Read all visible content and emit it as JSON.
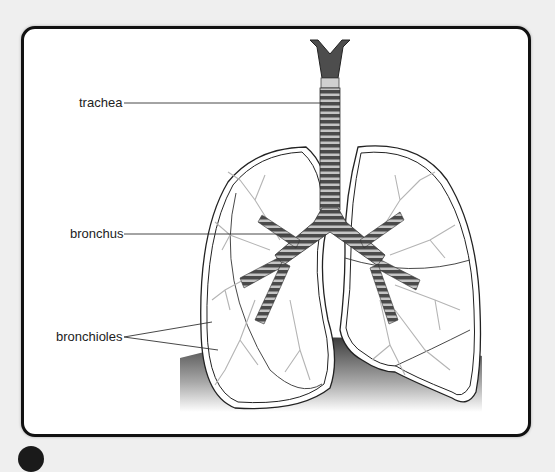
{
  "diagram": {
    "labels": [
      {
        "id": "trachea",
        "text": "trachea"
      },
      {
        "id": "bronchus",
        "text": "bronchus"
      },
      {
        "id": "bronchioles",
        "text": "bronchioles"
      }
    ]
  },
  "colors": {
    "frame_border": "#111111",
    "background": "#efefef",
    "airway_dark": "#4a4a4a",
    "airway_light": "#bdbdbd",
    "branches": "#b0b0b0"
  }
}
